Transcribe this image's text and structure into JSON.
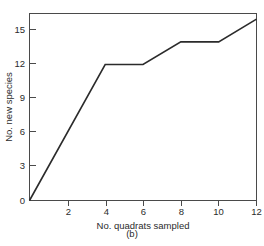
{
  "figure": {
    "caption": "(b)",
    "background_color": "#ffffff",
    "line_color": "#2b2b2b",
    "axis_color": "#4a4a4a"
  },
  "chart_data": {
    "type": "line",
    "title": "",
    "subtitle": "",
    "xlabel": "No. quadrats sampled",
    "ylabel": "No. new species",
    "xlim": [
      0,
      12
    ],
    "ylim": [
      0,
      16.5
    ],
    "grid": false,
    "legend": false,
    "legend_position": "none",
    "annotations": [
      "(b)"
    ],
    "xticks": [
      0,
      2,
      4,
      6,
      8,
      10,
      12
    ],
    "xtick_labels": [
      "",
      "2",
      "4",
      "6",
      "8",
      "10",
      "12"
    ],
    "yticks": [
      0,
      3,
      6,
      9,
      12,
      15
    ],
    "ytick_labels": [
      "0",
      "3",
      "6",
      "9",
      "12",
      "15"
    ],
    "series": [
      {
        "name": "cumulative new species",
        "x": [
          0,
          4,
          6,
          8,
          10,
          12
        ],
        "values": [
          0,
          12,
          12,
          14,
          14,
          16
        ]
      }
    ],
    "points": [
      {
        "x": 0,
        "y": 0
      },
      {
        "x": 4,
        "y": 12
      },
      {
        "x": 6,
        "y": 12
      },
      {
        "x": 8,
        "y": 14
      },
      {
        "x": 10,
        "y": 14
      },
      {
        "x": 12,
        "y": 16
      }
    ]
  }
}
